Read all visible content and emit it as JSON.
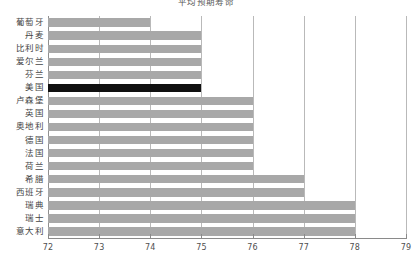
{
  "chart_data": {
    "type": "bar",
    "orientation": "horizontal",
    "title": "平均预期寿命",
    "xlabel": "",
    "ylabel": "",
    "xlim": [
      72,
      79
    ],
    "xticks": [
      72,
      73,
      74,
      75,
      76,
      77,
      78,
      79
    ],
    "xtick_labels": [
      "72",
      "73",
      "74",
      "75",
      "76",
      "77",
      "78",
      "79"
    ],
    "grid": true,
    "legend": false,
    "categories": [
      "葡萄牙",
      "丹麦",
      "比利时",
      "爱尔兰",
      "芬兰",
      "美国",
      "卢森堡",
      "英国",
      "奥地利",
      "德国",
      "法国",
      "荷兰",
      "希腊",
      "西班牙",
      "瑞典",
      "瑞士",
      "意大利"
    ],
    "values": [
      74,
      75,
      75,
      75,
      75,
      75,
      76,
      76,
      76,
      76,
      76,
      76,
      77,
      77,
      78,
      78,
      78
    ],
    "colors": {
      "bar": "#a8a8a8",
      "highlight": "#101010",
      "grid": "#b9b9b9",
      "axis": "#8a8a8a",
      "background": "#ffffff"
    },
    "highlight_category": "美国",
    "highlight_index": 5,
    "annotations": []
  }
}
